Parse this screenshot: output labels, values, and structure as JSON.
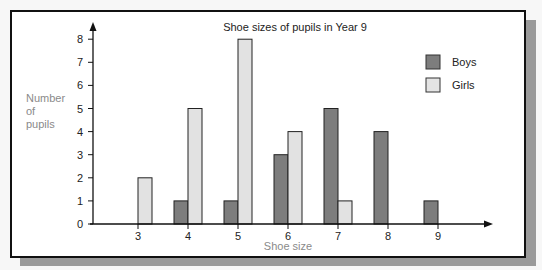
{
  "chart_data": {
    "type": "bar",
    "title": "Shoe sizes of pupils in Year 9",
    "xlabel": "Shoe size",
    "ylabel": "Number of pupils",
    "ylabel_lines": [
      "Number",
      "of",
      "pupils"
    ],
    "categories": [
      "3",
      "4",
      "5",
      "6",
      "7",
      "8",
      "9"
    ],
    "series": [
      {
        "name": "Boys",
        "color": "#7d7d7d",
        "values": [
          0,
          1,
          1,
          3,
          5,
          4,
          1
        ]
      },
      {
        "name": "Girls",
        "color": "#dcdcdc",
        "values": [
          2,
          5,
          8,
          4,
          1,
          0,
          0
        ]
      }
    ],
    "yticks": [
      "0",
      "1",
      "2",
      "3",
      "4",
      "5",
      "6",
      "7",
      "8"
    ],
    "ylim": [
      0,
      8
    ],
    "grid": false,
    "legend_position": "top-right"
  }
}
